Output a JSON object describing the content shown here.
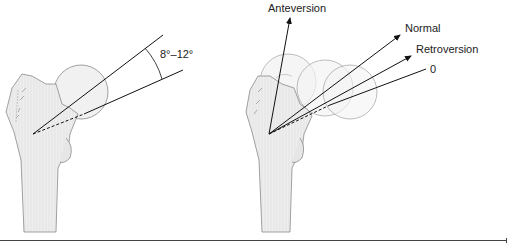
{
  "figure": {
    "left_panel": {
      "name": "normal-femoral-neck-angle",
      "angle_label": "8°–12°"
    },
    "right_panel": {
      "name": "femoral-version-comparison",
      "labels": {
        "anteversion": "Anteversion",
        "normal": "Normal",
        "retroversion": "Retroversion",
        "zero": "0"
      }
    }
  },
  "colors": {
    "bone_fill": "#ececec",
    "bone_stroke": "#8a8a8a",
    "line": "#111111",
    "text": "#222222"
  }
}
